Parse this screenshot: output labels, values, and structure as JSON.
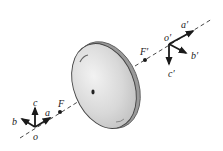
{
  "diagram": {
    "type": "lens-coordinate-frames",
    "colors": {
      "ink": "#1a1a1a",
      "lens_fill": "#d9d9d9",
      "lens_edge": "#444444",
      "background": "#ffffff"
    },
    "optical_axis": {
      "style": "dashed"
    },
    "object_frame": {
      "origin_label": "o",
      "axis_labels": {
        "a": "a",
        "b": "b",
        "c": "c"
      },
      "focal_point_label": "F"
    },
    "image_frame": {
      "origin_label": "o′",
      "axis_labels": {
        "a": "a′",
        "b": "b′",
        "c": "c′"
      },
      "focal_point_label": "F′"
    },
    "lens": {
      "label": ""
    }
  }
}
